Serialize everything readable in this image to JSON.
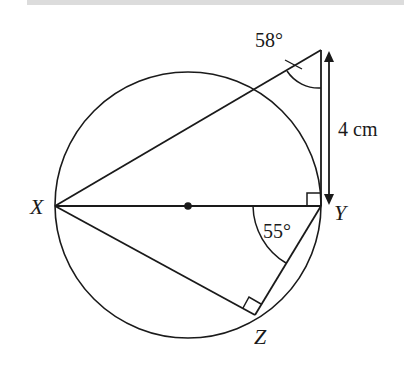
{
  "diagram": {
    "type": "circle-geometry",
    "points": {
      "X": {
        "label": "X"
      },
      "Y": {
        "label": "Y"
      },
      "Z": {
        "label": "Z"
      }
    },
    "angles": {
      "apex": "58°",
      "XYZ": "55°"
    },
    "measurement": {
      "label": "4 cm"
    },
    "colors": {
      "stroke": "#1a1a1a",
      "background": "#ffffff",
      "topbar": "#dcdcdc"
    }
  }
}
